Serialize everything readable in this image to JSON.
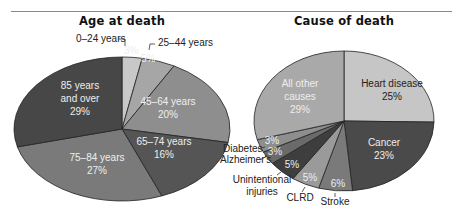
{
  "chart_data": [
    {
      "type": "pie",
      "title": "Age at death",
      "categories": [
        "0–24 years",
        "25–44 years",
        "45–64 years",
        "65–74 years",
        "75–84 years",
        "85 years and over"
      ],
      "values": [
        3,
        5,
        20,
        16,
        27,
        29
      ],
      "labels": [
        "3%",
        "5%",
        "20%",
        "16%",
        "27%",
        "29%"
      ],
      "colors": [
        "#c8c8c8",
        "#a6a6a6",
        "#8e8e8e",
        "#555555",
        "#7a7a7a",
        "#474747"
      ]
    },
    {
      "type": "pie",
      "title": "Cause of death",
      "categories": [
        "Heart disease",
        "Cancer",
        "Stroke",
        "CLRD",
        "Unintentional injuries",
        "Alzheimer's",
        "Diabetes",
        "All other causes"
      ],
      "values": [
        25,
        23,
        6,
        5,
        5,
        3,
        3,
        29
      ],
      "labels": [
        "25%",
        "23%",
        "6%",
        "5%",
        "5%",
        "3%",
        "3%",
        "29%"
      ],
      "colors": [
        "#c6c6c6",
        "#4a4a4a",
        "#7a7a7a",
        "#9a9a9a",
        "#3e3e3e",
        "#6a6a6a",
        "#8e8e8e",
        "#a9a9a9"
      ]
    }
  ],
  "left": {
    "title": "Age at death",
    "slices": [
      {
        "name": "0–24 years",
        "pct": "3%"
      },
      {
        "name": "25–44 years",
        "pct": "5%"
      },
      {
        "name_line1": "45–64 years",
        "pct": "20%"
      },
      {
        "name_line1": "65–74 years",
        "pct": "16%"
      },
      {
        "name_line1": "75–84 years",
        "pct": "27%"
      },
      {
        "name_line1": "85 years",
        "name_line2": "and over",
        "pct": "29%"
      }
    ]
  },
  "right": {
    "title": "Cause of death",
    "slices": [
      {
        "name_line1": "Heart disease",
        "pct": "25%"
      },
      {
        "name_line1": "Cancer",
        "pct": "23%"
      },
      {
        "name": "Stroke",
        "pct": "6%"
      },
      {
        "name": "CLRD",
        "pct": "5%"
      },
      {
        "name_line1": "Unintentional",
        "name_line2": "injuries",
        "pct": "5%"
      },
      {
        "name": "Alzheimer's",
        "pct": "3%"
      },
      {
        "name": "Diabetes",
        "pct": "3%"
      },
      {
        "name_line1": "All other",
        "name_line2": "causes",
        "pct": "29%"
      }
    ]
  }
}
